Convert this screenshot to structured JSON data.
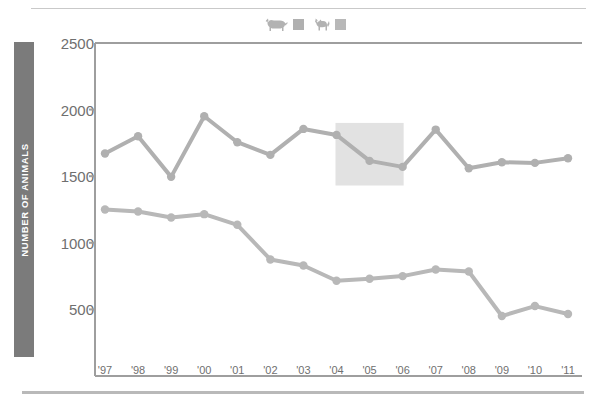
{
  "chart_data": {
    "type": "line",
    "title": "",
    "xlabel": "",
    "ylabel": "NUMBER OF ANIMALS",
    "categories": [
      "'97",
      "'98",
      "'99",
      "'00",
      "'01",
      "'02",
      "'03",
      "'04",
      "'05",
      "'06",
      "'07",
      "'08",
      "'09",
      "'10",
      "'11"
    ],
    "ylim": [
      0,
      2500
    ],
    "yticks": [
      500,
      1000,
      1500,
      2000,
      2500
    ],
    "ytick_labels": [
      "500",
      "1000",
      "1500",
      "2000",
      "2500"
    ],
    "grid": false,
    "legend_position": "top-center",
    "series": [
      {
        "name": "dogs",
        "icon": "dog-icon",
        "color": "#b0b0b0",
        "values": [
          1670,
          1800,
          1495,
          1950,
          1755,
          1660,
          1855,
          1810,
          1615,
          1570,
          1850,
          1560,
          1605,
          1600,
          1635
        ]
      },
      {
        "name": "cats",
        "icon": "cat-icon",
        "color": "#b8b8b8",
        "values": [
          1250,
          1235,
          1190,
          1215,
          1135,
          875,
          830,
          715,
          730,
          750,
          800,
          785,
          450,
          525,
          465
        ]
      }
    ],
    "annotations": [
      {
        "type": "highlight-box",
        "x_start": "'04",
        "x_end": "'06",
        "y_top": 1900,
        "y_bottom": 1430,
        "color": "#e2e2e2"
      }
    ]
  },
  "axis": {
    "y_title": "NUMBER OF ANIMALS",
    "y_title_bg": "#7b7b7b",
    "axis_color": "#9e9e9e"
  },
  "legend": {
    "items": [
      {
        "icon": "dog-icon",
        "swatch_color": "#b0b0b0"
      },
      {
        "icon": "cat-icon",
        "swatch_color": "#b8b8b8"
      }
    ]
  },
  "colors": {
    "background": "#ffffff",
    "dog_line": "#b0b0b0",
    "cat_line": "#b8b8b8",
    "text": "#6f6f6f",
    "rule": "#c9c9c9",
    "highlight": "#e2e2e2"
  }
}
